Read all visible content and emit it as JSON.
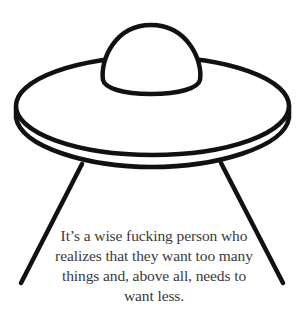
{
  "illustration": {
    "subject": "ufo-flying-saucer-icon",
    "stroke_color": "#111111",
    "background_color": "#ffffff"
  },
  "quote": {
    "lines": [
      "It’s a wise fucking person who",
      "realizes that they want too many",
      "things and, above all, needs to",
      "want less."
    ],
    "text_color": "#3a3a3a"
  }
}
